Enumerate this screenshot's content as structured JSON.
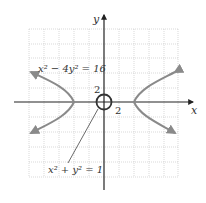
{
  "figure": {
    "axes": {
      "x_label": "x",
      "y_label": "y"
    },
    "tick_labels": {
      "x_tick": "2",
      "y_tick": "2"
    },
    "curves": [
      {
        "name": "hyperbola",
        "equation_lhs_a": "x",
        "equation_lhs_b": " − 4y",
        "equation_rhs": " = 16",
        "label": "x² − 4y² = 16"
      },
      {
        "name": "circle",
        "label": "x² + y² = 1"
      }
    ],
    "grid": {
      "units_per_square": 2,
      "x_range": [
        -10,
        10
      ],
      "y_range": [
        -10,
        10
      ]
    },
    "colors": {
      "grid": "#c8c8c8",
      "axis": "#222222",
      "curve": "#8a8a8a",
      "text": "#333333"
    }
  },
  "text": {
    "hyperbola_label": "x² − 4y² = 16",
    "circle_label": "x² + y² = 1",
    "x_axis": "x",
    "y_axis": "y",
    "tick_x": "2",
    "tick_y": "2"
  }
}
